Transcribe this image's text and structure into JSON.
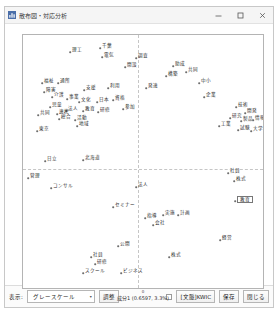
{
  "window": {
    "title": "散布図・対応分析",
    "icon": "chart-app-icon",
    "minimize_label": "–",
    "maximize_label": "□",
    "close_label": "✕"
  },
  "chart_data": {
    "type": "scatter",
    "title": "",
    "xlabel": "成分1 (0.6597, 3.3%)",
    "ylabel": "成分2 (0.5803, 2.6%)",
    "x_origin_tick": "0",
    "grid": false,
    "crosshair_x": 0,
    "crosshair_y": 0,
    "points": [
      {
        "label": "理工",
        "x": 47,
        "y": 17,
        "side": "right"
      },
      {
        "label": "千葉",
        "x": 77,
        "y": 13,
        "side": "right"
      },
      {
        "label": "電気",
        "x": 79,
        "y": 22,
        "side": "right"
      },
      {
        "label": "調査",
        "x": 113,
        "y": 23,
        "side": "right"
      },
      {
        "label": "開設",
        "x": 102,
        "y": 32,
        "side": "right"
      },
      {
        "label": "助成",
        "x": 150,
        "y": 31,
        "side": "right"
      },
      {
        "label": "共同",
        "x": 163,
        "y": 37,
        "side": "right"
      },
      {
        "label": "構築",
        "x": 143,
        "y": 41,
        "side": "right"
      },
      {
        "label": "中小",
        "x": 176,
        "y": 48,
        "side": "right"
      },
      {
        "label": "発達",
        "x": 123,
        "y": 53,
        "side": "right"
      },
      {
        "label": "福祉",
        "x": 19,
        "y": 48,
        "side": "right"
      },
      {
        "label": "通所",
        "x": 35,
        "y": 48,
        "side": "right"
      },
      {
        "label": "障害",
        "x": 21,
        "y": 57,
        "side": "right"
      },
      {
        "label": "支援",
        "x": 61,
        "y": 55,
        "side": "right"
      },
      {
        "label": "利用",
        "x": 85,
        "y": 53,
        "side": "right"
      },
      {
        "label": "介護",
        "x": 29,
        "y": 62,
        "side": "right"
      },
      {
        "label": "事業",
        "x": 44,
        "y": 64,
        "side": "right"
      },
      {
        "label": "文化",
        "x": 56,
        "y": 67,
        "side": "right"
      },
      {
        "label": "日本",
        "x": 74,
        "y": 67,
        "side": "right"
      },
      {
        "label": "資格",
        "x": 90,
        "y": 65,
        "side": "right"
      },
      {
        "label": "児童",
        "x": 27,
        "y": 72,
        "side": "right"
      },
      {
        "label": "企業",
        "x": 181,
        "y": 62,
        "side": "right"
      },
      {
        "label": "法人",
        "x": 43,
        "y": 76,
        "side": "right"
      },
      {
        "label": "教育",
        "x": 60,
        "y": 76,
        "side": "right"
      },
      {
        "label": "研修",
        "x": 75,
        "y": 77,
        "side": "right"
      },
      {
        "label": "参加",
        "x": 100,
        "y": 74,
        "side": "right"
      },
      {
        "label": "共同",
        "x": 15,
        "y": 80,
        "side": "right"
      },
      {
        "label": "連携",
        "x": 34,
        "y": 79,
        "side": "right"
      },
      {
        "label": "総合",
        "x": 36,
        "y": 84,
        "side": "right"
      },
      {
        "label": "活動",
        "x": 52,
        "y": 85,
        "side": "right"
      },
      {
        "label": "地域",
        "x": 54,
        "y": 91,
        "side": "right"
      },
      {
        "label": "東京",
        "x": 14,
        "y": 96,
        "side": "right"
      },
      {
        "label": "技術",
        "x": 213,
        "y": 72,
        "side": "right"
      },
      {
        "label": "開発",
        "x": 222,
        "y": 78,
        "side": "right"
      },
      {
        "label": "研究",
        "x": 207,
        "y": 83,
        "side": "right"
      },
      {
        "label": "製品",
        "x": 218,
        "y": 86,
        "side": "right"
      },
      {
        "label": "情報",
        "x": 230,
        "y": 85,
        "side": "right"
      },
      {
        "label": "工業",
        "x": 196,
        "y": 91,
        "side": "right"
      },
      {
        "label": "試験",
        "x": 215,
        "y": 95,
        "side": "right"
      },
      {
        "label": "大学",
        "x": 228,
        "y": 96,
        "side": "right"
      },
      {
        "label": "日立",
        "x": 22,
        "y": 126,
        "side": "right"
      },
      {
        "label": "北海道",
        "x": 60,
        "y": 125,
        "side": "right"
      },
      {
        "label": "管理",
        "x": 5,
        "y": 143,
        "side": "right"
      },
      {
        "label": "社員",
        "x": 205,
        "y": 138,
        "side": "right"
      },
      {
        "label": "株式",
        "x": 211,
        "y": 146,
        "side": "right"
      },
      {
        "label": "コンサル",
        "x": 28,
        "y": 153,
        "side": "right"
      },
      {
        "label": "法人",
        "x": 113,
        "y": 152,
        "side": "right"
      },
      {
        "label": "セミナー",
        "x": 90,
        "y": 172,
        "side": "right"
      },
      {
        "label": "指導",
        "x": 122,
        "y": 183,
        "side": "right"
      },
      {
        "label": "実施",
        "x": 140,
        "y": 180,
        "side": "right"
      },
      {
        "label": "計画",
        "x": 155,
        "y": 180,
        "side": "right"
      },
      {
        "label": "会社",
        "x": 130,
        "y": 190,
        "side": "right"
      },
      {
        "label": "経営",
        "x": 197,
        "y": 205,
        "side": "right"
      },
      {
        "label": "公開",
        "x": 95,
        "y": 211,
        "side": "right"
      },
      {
        "label": "社員",
        "x": 68,
        "y": 222,
        "side": "right"
      },
      {
        "label": "研修",
        "x": 72,
        "y": 229,
        "side": "right"
      },
      {
        "label": "スクール",
        "x": 60,
        "y": 238,
        "side": "right"
      },
      {
        "label": "ビジネス",
        "x": 98,
        "y": 238,
        "side": "right"
      },
      {
        "label": "株式",
        "x": 146,
        "y": 222,
        "side": "right"
      }
    ],
    "selected_point": {
      "label": "教育",
      "x": 212,
      "y": 166
    }
  },
  "toolbar": {
    "display_label": "表示:",
    "display_value": "グレースケール",
    "display_caret": "▾",
    "adjust_label": "調整",
    "kwic_label": "[文脈]KWIC",
    "save_label": "保存",
    "close_label": "閉じる",
    "kwic_checked": false
  }
}
